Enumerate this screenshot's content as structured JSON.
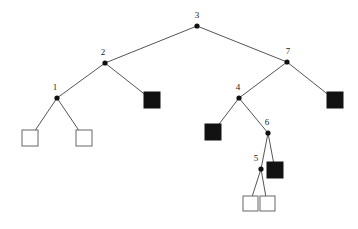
{
  "figure": {
    "background_color": "#ffffff",
    "width": 358,
    "height": 229,
    "edge_color": "#555555",
    "internal_node_color": "#111111",
    "filled_leaf_color": "#121212",
    "open_leaf_fill": "#ffffff",
    "open_leaf_stroke": "#666666"
  },
  "chart_data": {
    "type": "diagram",
    "diagram_kind": "binary-tree",
    "title": "",
    "xlabel": "",
    "ylabel": "",
    "legend": [],
    "internal_nodes": [
      {
        "id": "n3",
        "label": "3",
        "x": 197,
        "y": 26,
        "label_x": 197,
        "label_y": 18
      },
      {
        "id": "n2",
        "label": "2",
        "x": 105,
        "y": 63,
        "label_x": 103,
        "label_y": 55
      },
      {
        "id": "n7",
        "label": "7",
        "x": 287,
        "y": 62,
        "label_x": 288,
        "label_y": 54
      },
      {
        "id": "n1",
        "label": "1",
        "x": 57,
        "y": 98,
        "label_x": 55,
        "label_y": 90
      },
      {
        "id": "n4",
        "label": "4",
        "x": 239,
        "y": 98,
        "label_x": 238,
        "label_y": 90
      },
      {
        "id": "n6",
        "label": "6",
        "x": 268,
        "y": 133,
        "label_x": 267,
        "label_y": 125
      },
      {
        "id": "n5",
        "label": "5",
        "x": 261,
        "y": 169,
        "label_x": 256,
        "label_y": 161
      }
    ],
    "leaves": [
      {
        "id": "l1",
        "kind": "open",
        "x": 22,
        "y": 130,
        "size": 16
      },
      {
        "id": "l2",
        "kind": "open",
        "x": 76,
        "y": 130,
        "size": 16
      },
      {
        "id": "l3",
        "kind": "filled",
        "x": 144,
        "y": 92,
        "size": 16
      },
      {
        "id": "l4",
        "kind": "filled",
        "x": 205,
        "y": 124,
        "size": 16
      },
      {
        "id": "l5",
        "kind": "filled",
        "x": 327,
        "y": 92,
        "size": 16
      },
      {
        "id": "l6",
        "kind": "filled",
        "x": 267,
        "y": 162,
        "size": 16
      },
      {
        "id": "l7",
        "kind": "open",
        "x": 243,
        "y": 196,
        "size": 15
      },
      {
        "id": "l8",
        "kind": "open",
        "x": 260,
        "y": 196,
        "size": 15
      }
    ],
    "edges": [
      {
        "from": "n3",
        "to": "n2",
        "x1": 197,
        "y1": 26,
        "x2": 105,
        "y2": 63
      },
      {
        "from": "n3",
        "to": "n7",
        "x1": 197,
        "y1": 26,
        "x2": 287,
        "y2": 62
      },
      {
        "from": "n2",
        "to": "n1",
        "x1": 105,
        "y1": 63,
        "x2": 57,
        "y2": 98
      },
      {
        "from": "n2",
        "to": "l3",
        "x1": 105,
        "y1": 63,
        "x2": 152,
        "y2": 100
      },
      {
        "from": "n1",
        "to": "l1",
        "x1": 57,
        "y1": 98,
        "x2": 30,
        "y2": 138
      },
      {
        "from": "n1",
        "to": "l2",
        "x1": 57,
        "y1": 98,
        "x2": 84,
        "y2": 138
      },
      {
        "from": "n7",
        "to": "n4",
        "x1": 287,
        "y1": 62,
        "x2": 239,
        "y2": 98
      },
      {
        "from": "n7",
        "to": "l5",
        "x1": 287,
        "y1": 62,
        "x2": 335,
        "y2": 100
      },
      {
        "from": "n4",
        "to": "l4",
        "x1": 239,
        "y1": 98,
        "x2": 213,
        "y2": 132
      },
      {
        "from": "n4",
        "to": "n6",
        "x1": 239,
        "y1": 98,
        "x2": 268,
        "y2": 133
      },
      {
        "from": "n6",
        "to": "n5",
        "x1": 268,
        "y1": 133,
        "x2": 261,
        "y2": 169
      },
      {
        "from": "n6",
        "to": "l6",
        "x1": 268,
        "y1": 133,
        "x2": 275,
        "y2": 170
      },
      {
        "from": "n5",
        "to": "l7",
        "x1": 261,
        "y1": 169,
        "x2": 250,
        "y2": 203
      },
      {
        "from": "n5",
        "to": "l8",
        "x1": 261,
        "y1": 169,
        "x2": 267,
        "y2": 203
      }
    ],
    "node_labels_visible": [
      "3",
      "2",
      "7",
      "1",
      "4",
      "6",
      "5"
    ]
  }
}
